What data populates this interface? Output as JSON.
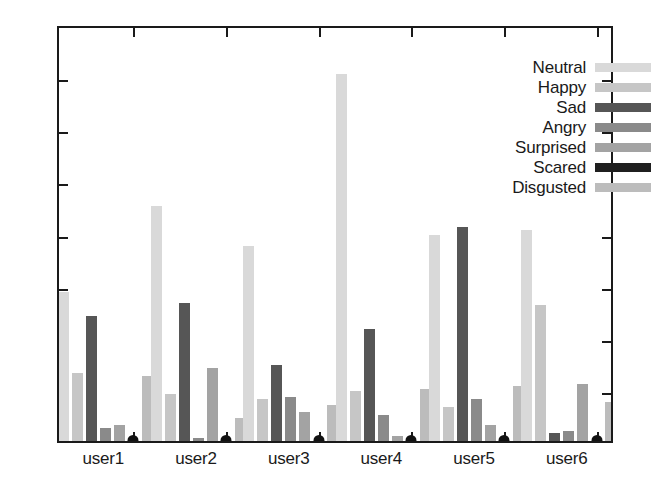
{
  "chart_data": {
    "type": "bar",
    "title": "",
    "xlabel": "",
    "ylabel": "",
    "categories": [
      "user1",
      "user2",
      "user3",
      "user4",
      "user5",
      "user6"
    ],
    "ylim": [
      0,
      0.8
    ],
    "ytick_labels": [
      "0",
      "0.1",
      "0.2",
      "0.3",
      "0.4",
      "0.5",
      "0.6",
      "0.7",
      "0.8"
    ],
    "ytick_values": [
      0,
      0.1,
      0.2,
      0.3,
      0.4,
      0.5,
      0.6,
      0.7,
      0.8
    ],
    "grid": false,
    "legend_position": "top-right",
    "series": [
      {
        "name": "Neutral",
        "color": "#d9d9d9",
        "values": [
          0.285,
          0.45,
          0.375,
          0.705,
          0.395,
          0.405
        ]
      },
      {
        "name": "Happy",
        "color": "#c6c6c6",
        "values": [
          0.13,
          0.09,
          0.08,
          0.095,
          0.065,
          0.26
        ]
      },
      {
        "name": "Sad",
        "color": "#565656",
        "values": [
          0.24,
          0.265,
          0.145,
          0.215,
          0.41,
          0.015
        ]
      },
      {
        "name": "Angry",
        "color": "#8a8a8a",
        "values": [
          0.025,
          0.005,
          0.085,
          0.05,
          0.08,
          0.02
        ]
      },
      {
        "name": "Surprised",
        "color": "#a3a3a3",
        "values": [
          0.03,
          0.14,
          0.055,
          0.01,
          0.03,
          0.11
        ]
      },
      {
        "name": "Scared",
        "color": "#1f1f1f",
        "values": [
          0.0,
          0.0,
          0.0,
          0.0,
          0.0,
          0.0
        ]
      },
      {
        "name": "Disgusted",
        "color": "#bcbcbc",
        "values": [
          0.125,
          0.045,
          0.07,
          0.1,
          0.105,
          0.075
        ]
      }
    ]
  },
  "legend": {
    "entries": [
      {
        "label": "Neutral",
        "color": "#d9d9d9"
      },
      {
        "label": "Happy",
        "color": "#c6c6c6"
      },
      {
        "label": "Sad",
        "color": "#565656"
      },
      {
        "label": "Angry",
        "color": "#8a8a8a"
      },
      {
        "label": "Surprised",
        "color": "#a3a3a3"
      },
      {
        "label": "Scared",
        "color": "#1f1f1f"
      },
      {
        "label": "Disgusted",
        "color": "#bcbcbc"
      }
    ]
  },
  "axis": {
    "frame_color": "#1a1a1a",
    "tick_color": "#1a1a1a"
  }
}
